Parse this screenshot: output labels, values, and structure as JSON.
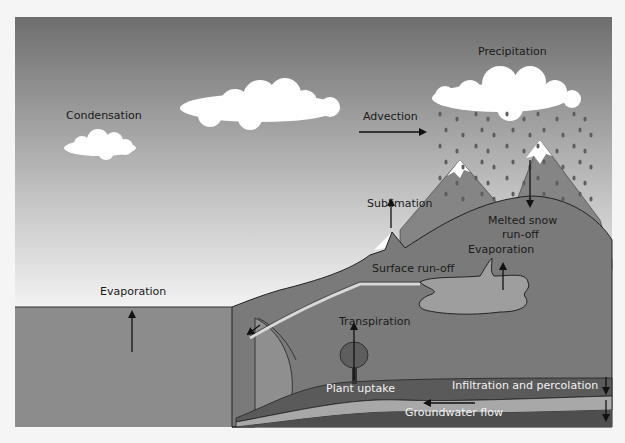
{
  "diagram": {
    "labels": {
      "precipitation": "Precipitation",
      "condensation": "Condensation",
      "advection": "Advection",
      "sublimation": "Sublimation",
      "melted_snow_line1": "Melted snow",
      "melted_snow_line2": "run-off",
      "evaporation_lake": "Evaporation",
      "evaporation_sea": "Evaporation",
      "surface_runoff": "Surface run-off",
      "transpiration": "Transpiration",
      "plant_uptake": "Plant uptake",
      "infiltration": "Infiltration and percolation",
      "groundwater": "Groundwater flow"
    },
    "colors": {
      "sky_top": "#6e6e6e",
      "sky_bottom": "#f4f4f4",
      "sea": "#8c8c8c",
      "land": "#7a7a7a",
      "mountain": "#858585",
      "snow": "#ffffff",
      "lake": "#9e9e9e",
      "soil_dark": "#5a5a5a",
      "aquifer": "#a8a8a8",
      "bedrock": "#4e4e4e",
      "cloud": "#ffffff",
      "rain": "#5e5e5e",
      "arrow": "#111111"
    }
  }
}
